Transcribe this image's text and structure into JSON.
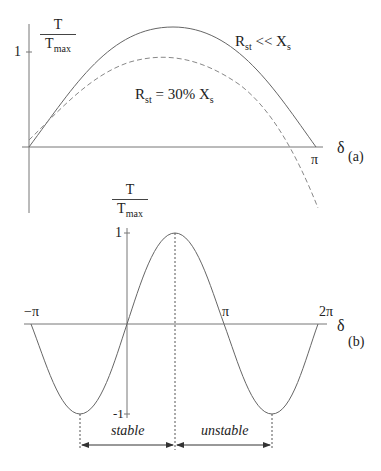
{
  "panel_a": {
    "y_label_num": "T",
    "y_label_den_main": "T",
    "y_label_den_sub": "max",
    "y_tick": "1",
    "x_tick": "π",
    "x_axis_label": "δ",
    "panel_label": "(a)",
    "curve1_label": {
      "main": "R",
      "sub": "st",
      "rel": " << X",
      "rel_sub": "s"
    },
    "curve2_label": {
      "main": "R",
      "sub": "st",
      "rel": " = 30% X",
      "rel_sub": "s"
    }
  },
  "panel_b": {
    "y_label_num": "T",
    "y_label_den_main": "T",
    "y_label_den_sub": "max",
    "y_tick_top": "1",
    "y_tick_bottom": "-1",
    "x_ticks": [
      "−π",
      "π",
      "2π"
    ],
    "x_axis_label": "δ",
    "panel_label": "(b)",
    "region_stable": "stable",
    "region_unstable": "unstable"
  },
  "colors": {
    "line": "#555555",
    "text": "#222222",
    "background": "#ffffff"
  }
}
